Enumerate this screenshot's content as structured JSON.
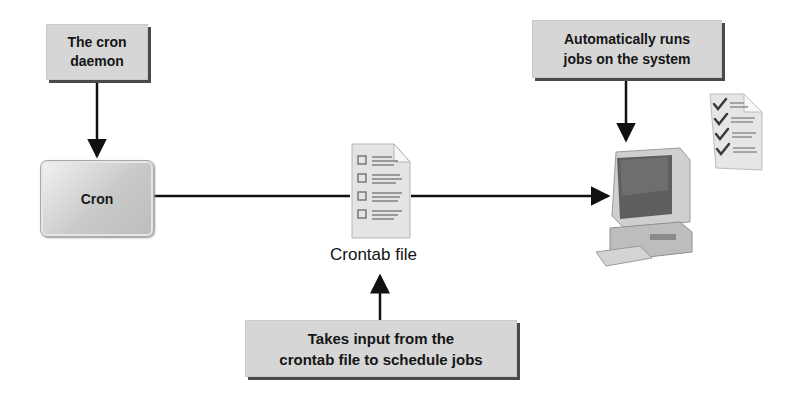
{
  "diagram": {
    "daemon_box": {
      "line1": "The cron",
      "line2": "daemon"
    },
    "cron_box": {
      "label": "Cron"
    },
    "crontab": {
      "label": "Crontab file"
    },
    "input_box": {
      "line1": "Takes input from the",
      "line2": "crontab file to schedule jobs"
    },
    "runs_box": {
      "line1": "Automatically runs",
      "line2": "jobs on the system"
    },
    "icons": {
      "crontab_document": "document-checklist-icon",
      "computer": "desktop-computer-icon",
      "completed_checklist": "checked-list-icon"
    },
    "colors": {
      "box_fill": "#d6d6d6",
      "box_shadow": "#4a4a4a",
      "arrow": "#111111"
    }
  }
}
